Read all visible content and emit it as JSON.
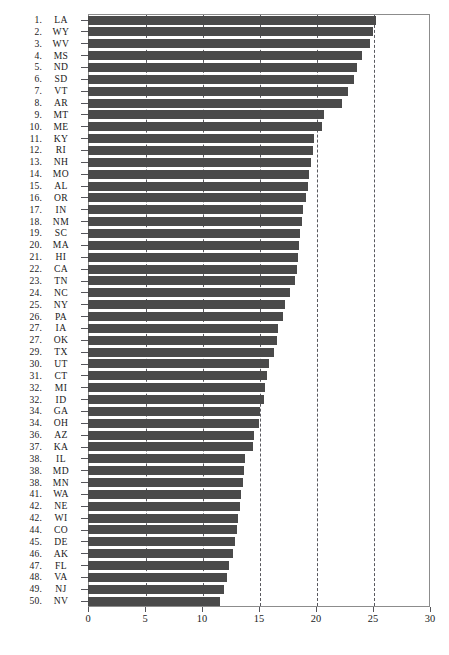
{
  "chart_data": {
    "type": "bar",
    "orientation": "horizontal",
    "title": "",
    "subtitle": "",
    "xlabel": "",
    "ylabel": "",
    "xlim": [
      0,
      30
    ],
    "ylim": null,
    "grid": true,
    "grid_style": "dashed-vertical",
    "legend": null,
    "legend_position": "none",
    "xticks": [
      0,
      5,
      10,
      15,
      20,
      25,
      30
    ],
    "xtick_labels": [
      "0",
      "5",
      "10",
      "15",
      "20",
      "25",
      "30"
    ],
    "bar_color": "#4a4a4a",
    "frame_color": "#8c8c8c",
    "gridline_color": "#58585e",
    "categories": [
      "LA",
      "WY",
      "WV",
      "MS",
      "ND",
      "SD",
      "VT",
      "AR",
      "MT",
      "ME",
      "KY",
      "RI",
      "NH",
      "MO",
      "AL",
      "OR",
      "IN",
      "NM",
      "SC",
      "MA",
      "HI",
      "CA",
      "TN",
      "NC",
      "NY",
      "PA",
      "IA",
      "OK",
      "TX",
      "UT",
      "CT",
      "MI",
      "ID",
      "GA",
      "OH",
      "AZ",
      "KA",
      "IL",
      "MD",
      "MN",
      "WA",
      "NE",
      "WI",
      "CO",
      "DE",
      "AK",
      "FL",
      "VA",
      "NJ",
      "NV"
    ],
    "ranks": [
      "1.",
      "2.",
      "3.",
      "4.",
      "5.",
      "6.",
      "7.",
      "8.",
      "9.",
      "10.",
      "11.",
      "12.",
      "13.",
      "14.",
      "15.",
      "16.",
      "17.",
      "18.",
      "19.",
      "20.",
      "21.",
      "22.",
      "23.",
      "24.",
      "25.",
      "26.",
      "27.",
      "27.",
      "29.",
      "30.",
      "31.",
      "32.",
      "32.",
      "34.",
      "34.",
      "36.",
      "37.",
      "38.",
      "38.",
      "38.",
      "41.",
      "42.",
      "42.",
      "44.",
      "45.",
      "46.",
      "47.",
      "48.",
      "49.",
      "50."
    ],
    "values": [
      25.3,
      25.0,
      24.7,
      24.0,
      23.6,
      23.3,
      22.8,
      22.3,
      20.7,
      20.5,
      19.8,
      19.7,
      19.6,
      19.4,
      19.3,
      19.1,
      18.9,
      18.8,
      18.6,
      18.5,
      18.4,
      18.3,
      18.2,
      17.7,
      17.3,
      17.1,
      16.7,
      16.6,
      16.3,
      15.9,
      15.7,
      15.5,
      15.4,
      15.1,
      15.0,
      14.6,
      14.5,
      13.8,
      13.7,
      13.6,
      13.4,
      13.3,
      13.2,
      13.1,
      12.9,
      12.7,
      12.4,
      12.2,
      11.9,
      11.6
    ]
  }
}
